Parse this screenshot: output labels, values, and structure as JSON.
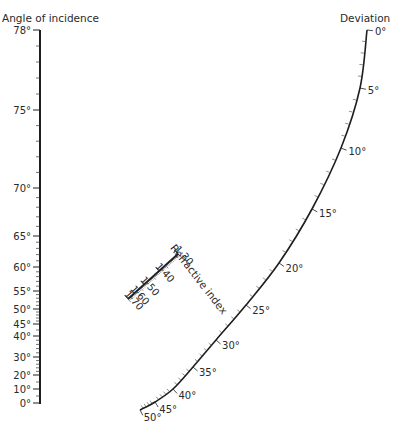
{
  "diagram": {
    "type": "nomogram",
    "left_scale": {
      "title": "Angle of incidence",
      "ticks": [
        {
          "label": "78°",
          "y": 30
        },
        {
          "label": "75°",
          "y": 110
        },
        {
          "label": "70°",
          "y": 188
        },
        {
          "label": "65°",
          "y": 236
        },
        {
          "label": "60°",
          "y": 267
        },
        {
          "label": "55°",
          "y": 291
        },
        {
          "label": "50°",
          "y": 309
        },
        {
          "label": "45°",
          "y": 324
        },
        {
          "label": "40°",
          "y": 336
        },
        {
          "label": "30°",
          "y": 357
        },
        {
          "label": "20°",
          "y": 375
        },
        {
          "label": "10°",
          "y": 389
        },
        {
          "label": "0°",
          "y": 403
        }
      ]
    },
    "middle_scale": {
      "title": "Refractive index",
      "ticks": [
        {
          "label": "1·30",
          "t": 0.0
        },
        {
          "label": "1·40",
          "t": 0.38
        },
        {
          "label": "1·50",
          "t": 0.68
        },
        {
          "label": "1·60",
          "t": 0.88
        },
        {
          "label": "1·70",
          "t": 1.0
        }
      ]
    },
    "right_scale": {
      "title": "Deviation",
      "ticks": [
        {
          "label": "0°",
          "x": 367,
          "y": 30
        },
        {
          "label": "5°",
          "x": 360,
          "y": 88
        },
        {
          "label": "10°",
          "x": 341,
          "y": 148
        },
        {
          "label": "15°",
          "x": 312,
          "y": 209
        },
        {
          "label": "20°",
          "x": 279,
          "y": 263
        },
        {
          "label": "25°",
          "x": 246,
          "y": 305
        },
        {
          "label": "30°",
          "x": 216,
          "y": 340
        },
        {
          "label": "35°",
          "x": 193,
          "y": 367
        },
        {
          "label": "40°",
          "x": 173,
          "y": 389
        },
        {
          "label": "45°",
          "x": 155,
          "y": 402
        },
        {
          "label": "50°",
          "x": 140,
          "y": 410
        }
      ]
    }
  }
}
